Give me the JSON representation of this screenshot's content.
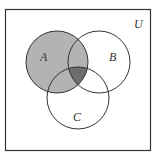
{
  "diagram": {
    "type": "venn",
    "universe_label": "U",
    "sets": [
      {
        "label": "A",
        "cx": 57,
        "cy": 62,
        "r": 31
      },
      {
        "label": "B",
        "cx": 99,
        "cy": 62,
        "r": 31
      },
      {
        "label": "C",
        "cx": 78,
        "cy": 98,
        "r": 31
      }
    ],
    "shaded_region": "A",
    "darker_region": "A ∩ B ∩ C",
    "colors": {
      "background": "#ffffff",
      "border": "#333333",
      "shade": "#b3b3b3",
      "dark_shade": "#6e6e6e"
    }
  }
}
